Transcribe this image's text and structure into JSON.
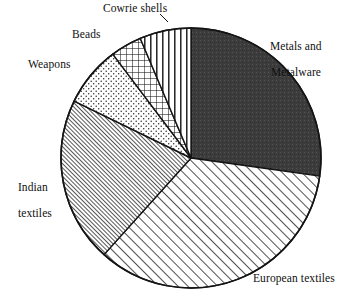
{
  "chart_data": {
    "type": "pie",
    "title": "",
    "subtitle": "",
    "xlabel": "",
    "ylabel": "",
    "legend_position": "none",
    "grid": false,
    "labels_placement": "outside",
    "start_angle_deg": 0,
    "direction": "clockwise",
    "center_px": [
      191,
      158
    ],
    "radius_px": 130,
    "categories": [
      "Metals and Metalware",
      "European textiles",
      "Indian textiles",
      "Weapons",
      "Beads",
      "Cowrie shells"
    ],
    "values": [
      27.2,
      34.4,
      20.6,
      7.5,
      3.9,
      6.4
    ],
    "units": "percent",
    "slices": [
      {
        "label": "Metals and Metalware",
        "label_line1": "Metals and",
        "label_line2": "Metalware",
        "value": 27.2,
        "start_deg": 0,
        "end_deg": 98,
        "pattern": "solid-dark",
        "color": "#3a3a3a"
      },
      {
        "label": "European textiles",
        "label_line1": "European textiles",
        "label_line2": "",
        "value": 34.4,
        "start_deg": 98,
        "end_deg": 222,
        "pattern": "diagonal-hatch",
        "color": "#ffffff"
      },
      {
        "label": "Indian textiles",
        "label_line1": "Indian",
        "label_line2": "textiles",
        "value": 20.6,
        "start_deg": 222,
        "end_deg": 296,
        "pattern": "dense-diagonal-hatch",
        "color": "#b9b9b9"
      },
      {
        "label": "Weapons",
        "label_line1": "Weapons",
        "label_line2": "",
        "value": 7.5,
        "start_deg": 296,
        "end_deg": 323,
        "pattern": "stipple-dots",
        "color": "#ffffff"
      },
      {
        "label": "Beads",
        "label_line1": "Beads",
        "label_line2": "",
        "value": 3.9,
        "start_deg": 323,
        "end_deg": 337,
        "pattern": "crosshatch-grid",
        "color": "#ffffff"
      },
      {
        "label": "Cowrie shells",
        "label_line1": "Cowrie shells",
        "label_line2": "",
        "value": 6.4,
        "start_deg": 337,
        "end_deg": 360,
        "pattern": "vertical-lines",
        "color": "#ffffff"
      }
    ],
    "outline_color": "#141414"
  }
}
